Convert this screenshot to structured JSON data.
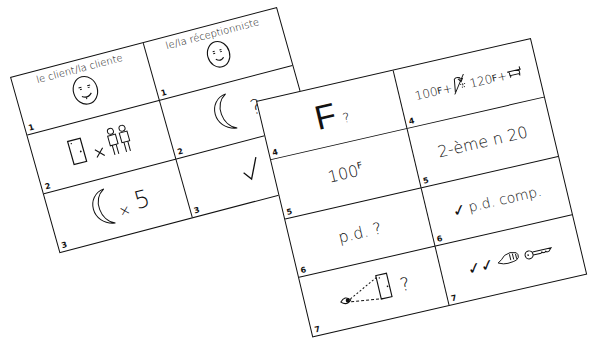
{
  "left_card": {
    "headers": [
      {
        "label": "le client/la cliente",
        "icon": "smiling-face-icon",
        "number": "1"
      },
      {
        "label": "le/la réceptionniste",
        "icon": "smiling-face-icon",
        "number": "1"
      }
    ],
    "rows": [
      {
        "client": {
          "icons": [
            "door-icon",
            "times-icon",
            "two-people-icon"
          ],
          "number": "2"
        },
        "receptionist": {
          "icons": [
            "moon-icon"
          ],
          "text": "?",
          "number": "2"
        }
      },
      {
        "client": {
          "icons": [
            "moon-icon"
          ],
          "text_x": "×",
          "text": "5",
          "number": "3"
        },
        "receptionist": {
          "icons": [
            "checkmark-icon"
          ],
          "text": "✓",
          "number": "3"
        }
      }
    ]
  },
  "right_card": {
    "rows": [
      {
        "client": {
          "text": "F",
          "suffix": "?",
          "number": "4"
        },
        "receptionist": {
          "text_a": "100",
          "sup_a": "F",
          "plus_a": "+",
          "icon_a": "shower-icon",
          "text_b": "120",
          "sup_b": "F",
          "plus_b": "+",
          "icon_b": "bathtub-icon",
          "number": "4"
        }
      },
      {
        "client": {
          "text": "100",
          "sup": "F",
          "number": "5"
        },
        "receptionist": {
          "text": "2-ème n 20",
          "number": "5"
        }
      },
      {
        "client": {
          "text": "p.d. ?",
          "number": "6"
        },
        "receptionist": {
          "check": "✓",
          "text": "p.d. comp.",
          "number": "6"
        }
      },
      {
        "client": {
          "icons": [
            "eye-icon",
            "dashed-line-icon",
            "door-icon"
          ],
          "text": "?",
          "number": "7"
        },
        "receptionist": {
          "text": "✓✓",
          "icons": [
            "hand-icon",
            "key-icon"
          ],
          "number": "7"
        }
      }
    ]
  }
}
